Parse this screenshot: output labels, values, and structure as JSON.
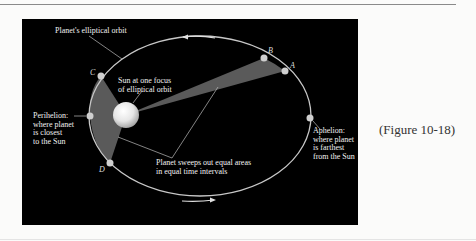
{
  "figure": {
    "caption": "(Figure 10-18)",
    "labels": {
      "orbit": "Planet's elliptical orbit",
      "sun_line1": "Sun at one focus",
      "sun_line2": "of elliptical orbit",
      "perihelion_line1": "Perihelion:",
      "perihelion_line2": "where planet",
      "perihelion_line3": "is closest",
      "perihelion_line4": "to the Sun",
      "aphelion_line1": "Aphelion:",
      "aphelion_line2": "where planet",
      "aphelion_line3": "is farthest",
      "aphelion_line4": "from the Sun",
      "sweep_line1": "Planet sweeps out equal areas",
      "sweep_line2": "in equal time intervals"
    },
    "points": {
      "A": "A",
      "B": "B",
      "C": "C",
      "D": "D"
    },
    "colors": {
      "background": "#000000",
      "orbit": "#c8c8c8",
      "swept_area": "#5a5a5a",
      "sun": "#f0f0f0"
    }
  }
}
